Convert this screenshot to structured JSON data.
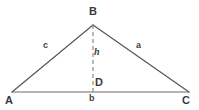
{
  "diagram": {
    "type": "triangle-with-altitude",
    "background_color": "#ffffff",
    "stroke_color": "#555555",
    "baseline_color": "#6a6a6a",
    "dashed_color": "#8a8a8a",
    "text_color": "#3f3f3f",
    "vertices": [
      {
        "id": "A",
        "label": "A",
        "x": 12,
        "y": 92
      },
      {
        "id": "B",
        "label": "B",
        "x": 93,
        "y": 25
      },
      {
        "id": "C",
        "label": "C",
        "x": 189,
        "y": 92
      },
      {
        "id": "D",
        "label": "D",
        "x": 93,
        "y": 92
      }
    ],
    "sides": [
      {
        "id": "c",
        "label": "c",
        "from": "A",
        "to": "B"
      },
      {
        "id": "a",
        "label": "a",
        "from": "B",
        "to": "C"
      },
      {
        "id": "b",
        "label": "b",
        "from": "A",
        "to": "C"
      }
    ],
    "altitude": {
      "id": "h",
      "label": "h",
      "from": "B",
      "to": "D",
      "style": "dashed",
      "dash_pattern": "4 3"
    }
  }
}
